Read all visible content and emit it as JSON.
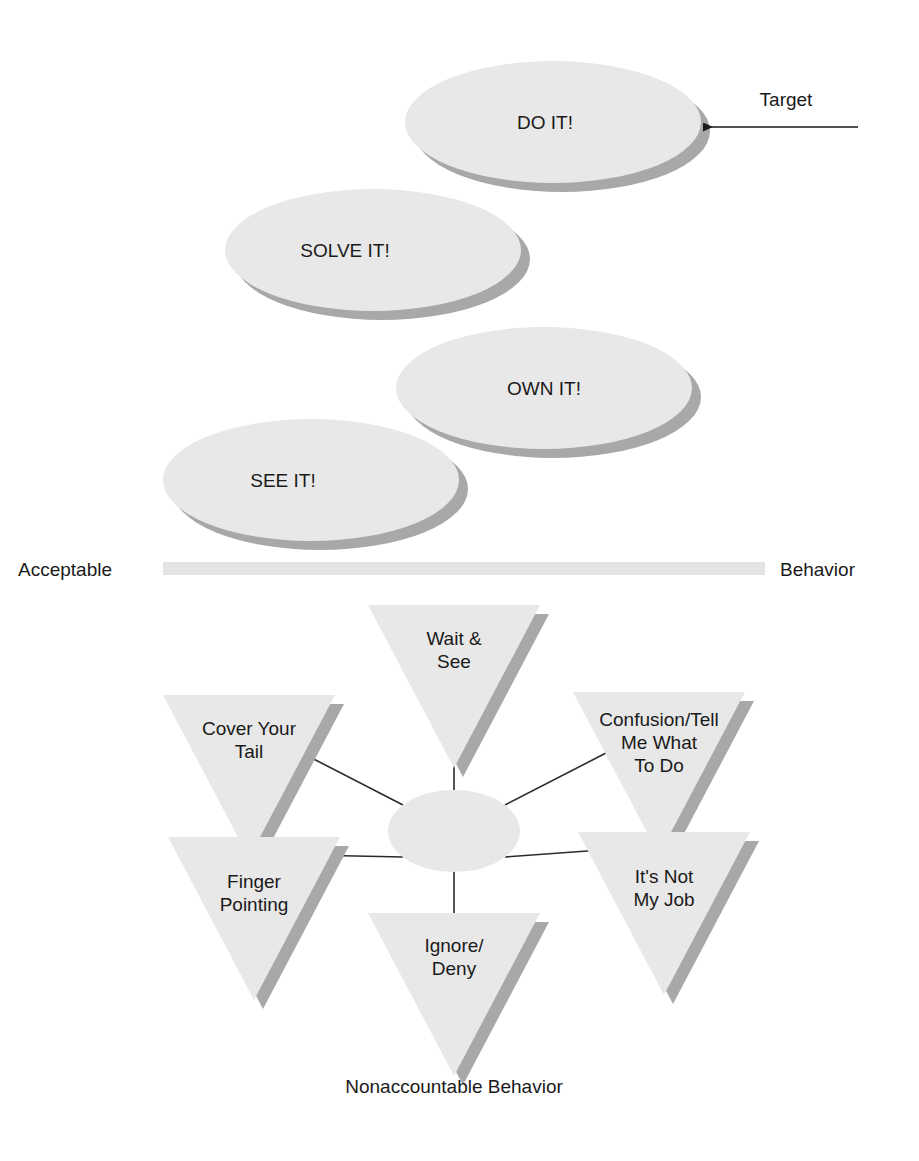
{
  "figure": {
    "accountable_label_left": "Acceptable",
    "accountable_label_right": "Behavior",
    "nonaccountable_caption": "Nonaccountable Behavior",
    "target_annotation": "Target",
    "colors": {
      "shape_fill": "#e8e8e8",
      "shape_shadow": "#a8a8a8",
      "band_fill": "#e4e4e4",
      "line": "#2b2b2b",
      "text": "#1a1a1a",
      "background": "#ffffff"
    }
  },
  "accountable_steps": [
    {
      "id": "see-it",
      "label": "SEE IT!",
      "cx": 311,
      "cy": 480,
      "rx": 148,
      "ry": 61,
      "tx": 283,
      "ty": 487
    },
    {
      "id": "own-it",
      "label": "OWN IT!",
      "cx": 544,
      "cy": 388,
      "rx": 148,
      "ry": 61,
      "tx": 544,
      "ty": 395
    },
    {
      "id": "solve-it",
      "label": "SOLVE IT!",
      "cx": 373,
      "cy": 250,
      "rx": 148,
      "ry": 61,
      "tx": 345,
      "ty": 257
    },
    {
      "id": "do-it",
      "label": "DO IT!",
      "cx": 553,
      "cy": 122,
      "rx": 148,
      "ry": 61,
      "tx": 545,
      "ty": 129
    }
  ],
  "band": {
    "x": 163,
    "y": 562,
    "width": 602,
    "height": 13
  },
  "target_arrow": {
    "x1": 858,
    "y1": 127,
    "x2": 703,
    "y2": 127,
    "label_x": 786,
    "label_y": 106
  },
  "center_hub": {
    "cx": 454,
    "cy": 831,
    "rx": 66,
    "ry": 41
  },
  "nonaccountable_items": [
    {
      "id": "wait-and-see",
      "lines": [
        "Wait &",
        "See"
      ],
      "left": 368,
      "top": 605,
      "width": 172,
      "height": 163,
      "tx": 454,
      "ty": 645
    },
    {
      "id": "cover-your-tail",
      "lines": [
        "Cover Your",
        "Tail"
      ],
      "left": 163,
      "top": 695,
      "width": 172,
      "height": 163,
      "tx": 249,
      "ty": 735
    },
    {
      "id": "confusion-tell-me",
      "lines": [
        "Confusion/Tell",
        "Me What",
        "To Do"
      ],
      "left": 573,
      "top": 692,
      "width": 172,
      "height": 163,
      "tx": 659,
      "ty": 726
    },
    {
      "id": "finger-pointing",
      "lines": [
        "Finger",
        "Pointing"
      ],
      "left": 168,
      "top": 837,
      "width": 172,
      "height": 163,
      "tx": 254,
      "ty": 888
    },
    {
      "id": "its-not-my-job",
      "lines": [
        "It's Not",
        "My Job"
      ],
      "left": 578,
      "top": 832,
      "width": 172,
      "height": 163,
      "tx": 664,
      "ty": 883
    },
    {
      "id": "ignore-deny",
      "lines": [
        "Ignore/",
        "Deny"
      ],
      "left": 368,
      "top": 913,
      "width": 172,
      "height": 163,
      "tx": 454,
      "ty": 952
    }
  ],
  "connectors": [
    {
      "id": "hub-to-wait-and-see",
      "x1": 454,
      "y1": 790,
      "x2": 454,
      "y2": 735
    },
    {
      "id": "hub-to-cover-tail",
      "x1": 403,
      "y1": 805,
      "x2": 302,
      "y2": 753
    },
    {
      "id": "hub-to-confusion",
      "x1": 505,
      "y1": 805,
      "x2": 606,
      "y2": 753
    },
    {
      "id": "hub-to-finger",
      "x1": 403,
      "y1": 857,
      "x2": 307,
      "y2": 855
    },
    {
      "id": "hub-to-not-my-job",
      "x1": 505,
      "y1": 857,
      "x2": 601,
      "y2": 850
    },
    {
      "id": "hub-to-ignore-deny",
      "x1": 454,
      "y1": 872,
      "x2": 454,
      "y2": 935
    }
  ],
  "caption": {
    "x": 454,
    "y": 1093
  }
}
